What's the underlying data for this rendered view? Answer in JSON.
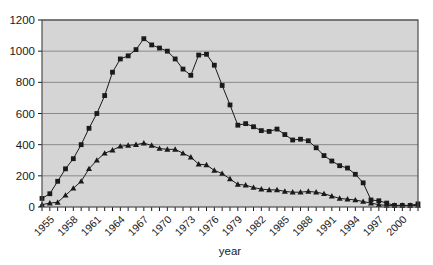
{
  "chart_data": {
    "type": "line",
    "title": "",
    "subtitle": "",
    "xlabel": "year",
    "ylabel": "",
    "xlim": [
      1954,
      2002
    ],
    "ylim": [
      0,
      1200
    ],
    "ytick_values": [
      0,
      200,
      400,
      600,
      800,
      1000,
      1200
    ],
    "ytick_labels": [
      "0",
      "200",
      "400",
      "600",
      "800",
      "1000",
      "1200"
    ],
    "xtick_labels": [
      "1955",
      "1958",
      "1961",
      "1964",
      "1967",
      "1970",
      "1973",
      "1976",
      "1979",
      "1982",
      "1985",
      "1988",
      "1991",
      "1994",
      "1997",
      "2000"
    ],
    "xtick_values": [
      1955,
      1958,
      1961,
      1964,
      1967,
      1970,
      1973,
      1976,
      1979,
      1982,
      1985,
      1988,
      1991,
      1994,
      1997,
      2000
    ],
    "xtick_label_rotation": -45,
    "grid": "horizontal",
    "legend": "none",
    "plot_background": "#d5d5d5",
    "series_color": "#1a1a1a",
    "x": [
      1954,
      1955,
      1956,
      1957,
      1958,
      1959,
      1960,
      1961,
      1962,
      1963,
      1964,
      1965,
      1966,
      1967,
      1968,
      1969,
      1970,
      1971,
      1972,
      1973,
      1974,
      1975,
      1976,
      1977,
      1978,
      1979,
      1980,
      1981,
      1982,
      1983,
      1984,
      1985,
      1986,
      1987,
      1988,
      1989,
      1990,
      1991,
      1992,
      1993,
      1994,
      1995,
      1996,
      1997,
      1998,
      1999,
      2000,
      2001,
      2002
    ],
    "series": [
      {
        "name": "series-squares",
        "marker": "square",
        "values": [
          55,
          85,
          165,
          245,
          310,
          400,
          505,
          600,
          715,
          865,
          950,
          970,
          1010,
          1080,
          1040,
          1020,
          1000,
          950,
          885,
          845,
          975,
          980,
          910,
          780,
          655,
          525,
          535,
          515,
          490,
          485,
          500,
          465,
          430,
          435,
          425,
          380,
          330,
          295,
          265,
          250,
          210,
          155,
          45,
          40,
          25,
          10,
          10,
          10,
          20
        ]
      },
      {
        "name": "series-triangles",
        "marker": "triangle",
        "values": [
          15,
          25,
          30,
          75,
          120,
          165,
          245,
          300,
          345,
          365,
          390,
          395,
          400,
          410,
          395,
          375,
          370,
          370,
          345,
          320,
          275,
          270,
          235,
          215,
          180,
          145,
          140,
          125,
          115,
          110,
          110,
          100,
          95,
          95,
          100,
          95,
          85,
          70,
          55,
          50,
          45,
          35,
          25,
          15,
          10,
          10,
          10,
          10,
          10
        ]
      }
    ]
  }
}
